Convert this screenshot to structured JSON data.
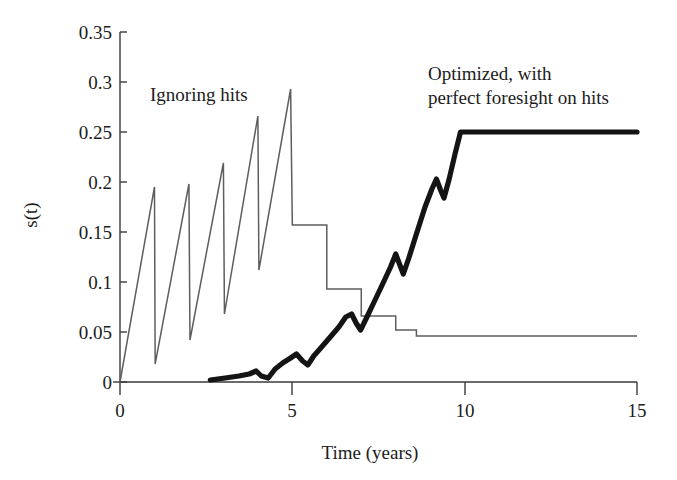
{
  "chart_data": {
    "type": "line",
    "title": "",
    "xlabel": "Time (years)",
    "ylabel": "s(t)",
    "xlim": [
      0,
      15
    ],
    "ylim": [
      0,
      0.35
    ],
    "xticks": [
      0,
      5,
      10,
      15
    ],
    "xtick_labels": [
      "0",
      "5",
      "10",
      "15"
    ],
    "yticks": [
      0,
      0.05,
      0.1,
      0.15,
      0.2,
      0.25,
      0.3,
      0.35
    ],
    "ytick_labels": [
      "0",
      "0.05",
      "0.1",
      "0.15",
      "0.2",
      "0.25",
      "0.3",
      "0.35"
    ],
    "grid": false,
    "legend_position": "inline-annotations",
    "series": [
      {
        "name": "Ignoring hits",
        "style": "thin",
        "color": "#5e5e5e",
        "line_width": 1.5,
        "annotation": "Ignoring hits",
        "annotation_xy": [
          1.0,
          0.305
        ],
        "points": [
          [
            0.0,
            0.0
          ],
          [
            1.0,
            0.195
          ],
          [
            1.02,
            0.018
          ],
          [
            2.0,
            0.198
          ],
          [
            2.03,
            0.042
          ],
          [
            3.0,
            0.219
          ],
          [
            3.03,
            0.068
          ],
          [
            4.0,
            0.266
          ],
          [
            4.03,
            0.112
          ],
          [
            4.95,
            0.293
          ],
          [
            5.0,
            0.157
          ],
          [
            6.0,
            0.157
          ],
          [
            6.0,
            0.093
          ],
          [
            7.0,
            0.093
          ],
          [
            7.0,
            0.066
          ],
          [
            8.0,
            0.066
          ],
          [
            8.0,
            0.052
          ],
          [
            8.6,
            0.052
          ],
          [
            8.6,
            0.046
          ],
          [
            15.0,
            0.046
          ]
        ]
      },
      {
        "name": "Optimized, with perfect foresight on hits",
        "style": "bold",
        "color": "#141414",
        "line_width": 5.2,
        "annotation": "Optimized, with perfect foresight on hits",
        "annotation_xy": [
          9.0,
          0.315
        ],
        "points": [
          [
            2.62,
            0.002
          ],
          [
            3.05,
            0.004
          ],
          [
            3.45,
            0.006
          ],
          [
            3.75,
            0.008
          ],
          [
            3.95,
            0.011
          ],
          [
            4.1,
            0.006
          ],
          [
            4.3,
            0.004
          ],
          [
            4.5,
            0.013
          ],
          [
            4.72,
            0.019
          ],
          [
            4.95,
            0.024
          ],
          [
            5.12,
            0.028
          ],
          [
            5.3,
            0.021
          ],
          [
            5.45,
            0.017
          ],
          [
            5.62,
            0.026
          ],
          [
            5.85,
            0.035
          ],
          [
            6.1,
            0.045
          ],
          [
            6.35,
            0.055
          ],
          [
            6.55,
            0.065
          ],
          [
            6.72,
            0.068
          ],
          [
            6.85,
            0.059
          ],
          [
            6.98,
            0.052
          ],
          [
            7.15,
            0.064
          ],
          [
            7.4,
            0.082
          ],
          [
            7.62,
            0.098
          ],
          [
            7.85,
            0.115
          ],
          [
            8.0,
            0.128
          ],
          [
            8.12,
            0.117
          ],
          [
            8.22,
            0.108
          ],
          [
            8.38,
            0.124
          ],
          [
            8.6,
            0.148
          ],
          [
            8.85,
            0.175
          ],
          [
            9.05,
            0.193
          ],
          [
            9.18,
            0.203
          ],
          [
            9.3,
            0.192
          ],
          [
            9.4,
            0.184
          ],
          [
            9.55,
            0.203
          ],
          [
            9.72,
            0.228
          ],
          [
            9.88,
            0.25
          ],
          [
            15.0,
            0.25
          ]
        ]
      }
    ]
  },
  "axes": {
    "y_label": "s(t)",
    "x_label": "Time (years)"
  },
  "annotations": {
    "thin_series_label": "Ignoring hits",
    "bold_series_label_line1": "Optimized, with",
    "bold_series_label_line2": "perfect foresight on hits"
  },
  "colors": {
    "background": "#ffffff",
    "thin_line": "#5e5e5e",
    "bold_line": "#141414",
    "axis": "#3a3a3a",
    "text": "#1c1c1c"
  }
}
